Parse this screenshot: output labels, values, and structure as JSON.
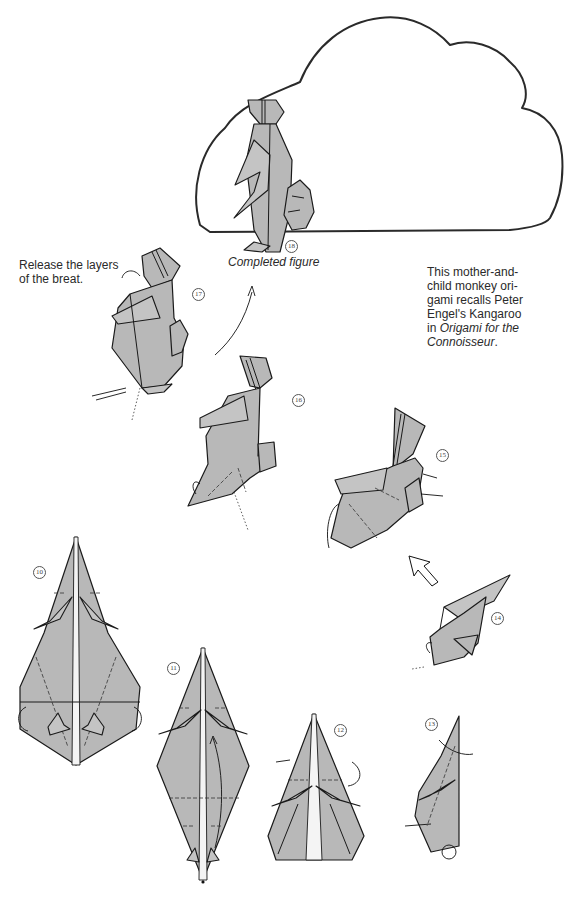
{
  "page": {
    "background": "#ffffff",
    "paper_color": "#b8b8b8",
    "line_color": "#1a1a1a"
  },
  "captions": {
    "step17_instruction_line1": "Release the layers",
    "step17_instruction_line2": "of the breat.",
    "completed_label": "Completed figure",
    "note_line1": "This mother-and-",
    "note_line2": "child monkey ori-",
    "note_line3": "gami recalls Peter",
    "note_line4": "Engel's Kangaroo",
    "note_line5_prefix": "in ",
    "note_line5_italic": "Origami for the",
    "note_line6_italic": "Connoisseur",
    "note_line6_suffix": "."
  },
  "steps": [
    {
      "number": "10",
      "glyph": "⑩",
      "description": "kite base with side flaps, corners folded behind"
    },
    {
      "number": "11",
      "glyph": "⑪",
      "description": "diamond with center strip, fold upward arrow"
    },
    {
      "number": "12",
      "glyph": "⑫",
      "description": "pentagon with legs, fold top behind"
    },
    {
      "number": "13",
      "glyph": "⑬",
      "description": "narrow side view, pleat and reverse folds"
    },
    {
      "number": "14",
      "glyph": "⑭",
      "description": "rotated figure, hollow arrow indicates turn"
    },
    {
      "number": "15",
      "glyph": "⑮",
      "description": "shaping head and child"
    },
    {
      "number": "16",
      "glyph": "⑯",
      "description": "mother figure with child, further shaping"
    },
    {
      "number": "17",
      "glyph": "⑰",
      "description": "release layers of the breast"
    },
    {
      "number": "18",
      "glyph": "⑱",
      "description": "completed mother-and-child monkey"
    }
  ]
}
